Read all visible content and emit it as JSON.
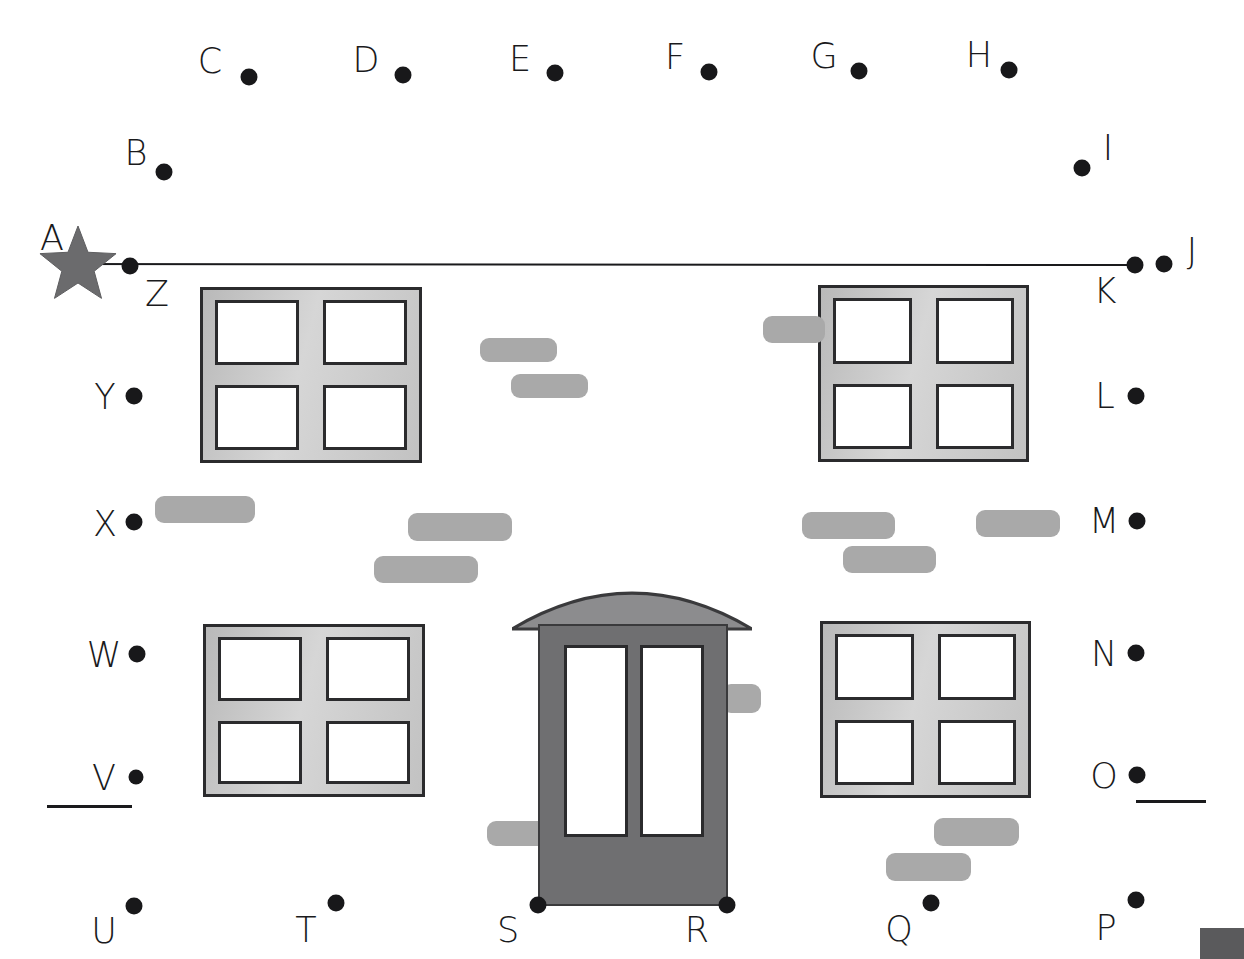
{
  "page": {
    "background_color": "#ffffff",
    "width": 1244,
    "height": 959
  },
  "colors": {
    "dot": "#18181a",
    "label": "#1a1a1c",
    "line": "#1a1a1c",
    "star_fill": "#6b6b6d",
    "window_frame_light": "#d6d6d6",
    "window_frame_dark": "#b9b9b9",
    "window_border": "#2b2b2d",
    "pane_fill": "#ffffff",
    "brick": "#a9a9a9",
    "door_body": "#6f6f71",
    "door_border": "#3a3a3c",
    "awning": "#8c8c8e",
    "corner_block": "#5a5a5c"
  },
  "dots": [
    {
      "letter": "A",
      "label_x": 52,
      "label_y": 238,
      "dot_x": null,
      "dot_y": null,
      "size": 0,
      "marker": "star"
    },
    {
      "letter": "B",
      "label_x": 136,
      "label_y": 153,
      "dot_x": 164,
      "dot_y": 172,
      "size": 17,
      "marker": "dot"
    },
    {
      "letter": "C",
      "label_x": 210,
      "label_y": 61,
      "dot_x": 249,
      "dot_y": 77,
      "size": 17,
      "marker": "dot"
    },
    {
      "letter": "D",
      "label_x": 366,
      "label_y": 60,
      "dot_x": 403,
      "dot_y": 75,
      "size": 17,
      "marker": "dot"
    },
    {
      "letter": "E",
      "label_x": 520,
      "label_y": 59,
      "dot_x": 555,
      "dot_y": 73,
      "size": 17,
      "marker": "dot"
    },
    {
      "letter": "F",
      "label_x": 675,
      "label_y": 57,
      "dot_x": 709,
      "dot_y": 72,
      "size": 17,
      "marker": "dot"
    },
    {
      "letter": "G",
      "label_x": 824,
      "label_y": 56,
      "dot_x": 859,
      "dot_y": 71,
      "size": 17,
      "marker": "dot"
    },
    {
      "letter": "H",
      "label_x": 979,
      "label_y": 55,
      "dot_x": 1009,
      "dot_y": 70,
      "size": 17,
      "marker": "dot"
    },
    {
      "letter": "I",
      "label_x": 1108,
      "label_y": 148,
      "dot_x": 1082,
      "dot_y": 168,
      "size": 17,
      "marker": "dot"
    },
    {
      "letter": "J",
      "label_x": 1192,
      "label_y": 251,
      "dot_x": 1164,
      "dot_y": 264,
      "size": 17,
      "marker": "dot"
    },
    {
      "letter": "K",
      "label_x": 1105,
      "label_y": 291,
      "dot_x": 1135,
      "dot_y": 265,
      "size": 17,
      "marker": "dot"
    },
    {
      "letter": "L",
      "label_x": 1105,
      "label_y": 396,
      "dot_x": 1136,
      "dot_y": 396,
      "size": 17,
      "marker": "dot"
    },
    {
      "letter": "M",
      "label_x": 1104,
      "label_y": 521,
      "dot_x": 1137,
      "dot_y": 521,
      "size": 17,
      "marker": "dot"
    },
    {
      "letter": "N",
      "label_x": 1104,
      "label_y": 654,
      "dot_x": 1136,
      "dot_y": 653,
      "size": 17,
      "marker": "dot"
    },
    {
      "letter": "O",
      "label_x": 1104,
      "label_y": 776,
      "dot_x": 1137,
      "dot_y": 775,
      "size": 17,
      "marker": "dot"
    },
    {
      "letter": "P",
      "label_x": 1106,
      "label_y": 928,
      "dot_x": 1136,
      "dot_y": 900,
      "size": 17,
      "marker": "dot"
    },
    {
      "letter": "Q",
      "label_x": 899,
      "label_y": 929,
      "dot_x": 931,
      "dot_y": 903,
      "size": 17,
      "marker": "dot"
    },
    {
      "letter": "R",
      "label_x": 697,
      "label_y": 930,
      "dot_x": 727,
      "dot_y": 905,
      "size": 17,
      "marker": "dot"
    },
    {
      "letter": "S",
      "label_x": 508,
      "label_y": 930,
      "dot_x": 538,
      "dot_y": 905,
      "size": 17,
      "marker": "dot"
    },
    {
      "letter": "T",
      "label_x": 306,
      "label_y": 930,
      "dot_x": 336,
      "dot_y": 903,
      "size": 17,
      "marker": "dot"
    },
    {
      "letter": "U",
      "label_x": 104,
      "label_y": 931,
      "dot_x": 134,
      "dot_y": 906,
      "size": 17,
      "marker": "dot"
    },
    {
      "letter": "V",
      "label_x": 104,
      "label_y": 778,
      "dot_x": 136,
      "dot_y": 777,
      "size": 15,
      "marker": "dot"
    },
    {
      "letter": "W",
      "label_x": 104,
      "label_y": 655,
      "dot_x": 137,
      "dot_y": 654,
      "size": 17,
      "marker": "dot"
    },
    {
      "letter": "X",
      "label_x": 105,
      "label_y": 524,
      "dot_x": 134,
      "dot_y": 522,
      "size": 17,
      "marker": "dot"
    },
    {
      "letter": "Y",
      "label_x": 105,
      "label_y": 397,
      "dot_x": 134,
      "dot_y": 396,
      "size": 17,
      "marker": "dot"
    },
    {
      "letter": "Z",
      "label_x": 157,
      "label_y": 294,
      "dot_x": 130,
      "dot_y": 266,
      "size": 17,
      "marker": "dot"
    }
  ],
  "connector_line": {
    "name": "line-A-to-K",
    "from": {
      "x": 64,
      "y": 264
    },
    "to": {
      "x": 1135,
      "y": 265
    },
    "width": 2
  },
  "star": {
    "cx": 78,
    "cy": 266,
    "outer_r": 40,
    "inner_r": 17,
    "points": 5
  },
  "windows": [
    {
      "name": "window-top-left",
      "x": 200,
      "y": 287,
      "w": 222,
      "h": 176
    },
    {
      "name": "window-top-right",
      "x": 818,
      "y": 285,
      "w": 211,
      "h": 177
    },
    {
      "name": "window-bottom-left",
      "x": 203,
      "y": 624,
      "w": 222,
      "h": 173
    },
    {
      "name": "window-bottom-right",
      "x": 820,
      "y": 621,
      "w": 211,
      "h": 177
    }
  ],
  "bricks": [
    {
      "x": 480,
      "y": 338,
      "w": 77,
      "h": 24
    },
    {
      "x": 511,
      "y": 374,
      "w": 77,
      "h": 24
    },
    {
      "x": 763,
      "y": 316,
      "w": 62,
      "h": 27
    },
    {
      "x": 155,
      "y": 496,
      "w": 100,
      "h": 27
    },
    {
      "x": 408,
      "y": 513,
      "w": 104,
      "h": 28
    },
    {
      "x": 374,
      "y": 556,
      "w": 104,
      "h": 27
    },
    {
      "x": 802,
      "y": 512,
      "w": 93,
      "h": 27
    },
    {
      "x": 843,
      "y": 546,
      "w": 93,
      "h": 27
    },
    {
      "x": 976,
      "y": 510,
      "w": 84,
      "h": 27
    },
    {
      "x": 722,
      "y": 684,
      "w": 39,
      "h": 29
    },
    {
      "x": 487,
      "y": 821,
      "w": 60,
      "h": 25
    },
    {
      "x": 934,
      "y": 818,
      "w": 85,
      "h": 28
    },
    {
      "x": 886,
      "y": 853,
      "w": 85,
      "h": 28
    }
  ],
  "door": {
    "name": "center-door",
    "body": {
      "x": 538,
      "y": 624,
      "w": 190,
      "h": 282
    },
    "glass_left": {
      "x": 564,
      "y": 645,
      "w": 64,
      "h": 192
    },
    "glass_right": {
      "x": 640,
      "y": 645,
      "w": 64,
      "h": 192
    },
    "awning": {
      "x": 512,
      "y": 577,
      "w": 240,
      "h": 52
    }
  },
  "underlines": [
    {
      "name": "underline-below-v",
      "x": 47,
      "y": 805,
      "w": 85
    },
    {
      "name": "underline-below-o",
      "x": 1136,
      "y": 800,
      "w": 70
    }
  ],
  "corner_block": {
    "name": "corner-block",
    "x": 1200,
    "y": 928,
    "w": 44,
    "h": 31
  },
  "crop_marks": [
    {
      "text": "⌒",
      "x": 748,
      "y": 4
    }
  ]
}
